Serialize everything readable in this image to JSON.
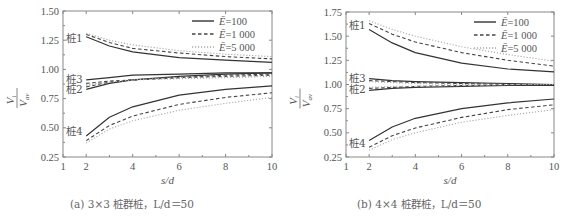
{
  "chart_data": [
    {
      "type": "line",
      "panel": "a",
      "caption": "(a) 3×3 桩群桩，L/d＝50",
      "xlabel": "s/d",
      "ylabel": "V_i / V_av",
      "xlim": [
        1,
        10
      ],
      "ylim": [
        0.25,
        1.5
      ],
      "xticks": [
        1,
        2,
        4,
        6,
        8,
        10
      ],
      "yticks": [
        "0.25",
        "0.50",
        "0.75",
        "1.00",
        "1.25",
        "1.50"
      ],
      "grid": false,
      "legend_position": "upper right",
      "legend": [
        "Ē=100",
        "Ē=1 000",
        "Ē=5 000"
      ],
      "x": [
        2,
        3,
        4,
        6,
        8,
        10
      ],
      "series": [
        {
          "pile": "桩1",
          "name": "Ē=100",
          "style": "solid",
          "values": [
            1.28,
            1.2,
            1.15,
            1.1,
            1.08,
            1.06
          ]
        },
        {
          "pile": "桩1",
          "name": "Ē=1 000",
          "style": "dashed",
          "values": [
            1.3,
            1.23,
            1.18,
            1.14,
            1.11,
            1.09
          ]
        },
        {
          "pile": "桩1",
          "name": "Ē=5 000",
          "style": "dotted",
          "values": [
            1.31,
            1.25,
            1.21,
            1.16,
            1.13,
            1.11
          ]
        },
        {
          "pile": "桩3",
          "name": "Ē=100",
          "style": "solid",
          "values": [
            0.91,
            0.93,
            0.95,
            0.96,
            0.97,
            0.97
          ]
        },
        {
          "pile": "桩3",
          "name": "Ē=1 000",
          "style": "dashed",
          "values": [
            0.88,
            0.9,
            0.91,
            0.93,
            0.94,
            0.95
          ]
        },
        {
          "pile": "桩3",
          "name": "Ē=5 000",
          "style": "dotted",
          "values": [
            0.87,
            0.89,
            0.91,
            0.92,
            0.93,
            0.94
          ]
        },
        {
          "pile": "桩2",
          "name": "Ē=100",
          "style": "solid",
          "values": [
            0.83,
            0.88,
            0.91,
            0.94,
            0.96,
            0.97
          ]
        },
        {
          "pile": "桩2",
          "name": "Ē=1 000",
          "style": "dashed",
          "values": [
            0.85,
            0.89,
            0.91,
            0.93,
            0.95,
            0.96
          ]
        },
        {
          "pile": "桩2",
          "name": "Ē=5 000",
          "style": "dotted",
          "values": [
            0.86,
            0.89,
            0.91,
            0.93,
            0.94,
            0.95
          ]
        },
        {
          "pile": "桩4",
          "name": "Ē=100",
          "style": "solid",
          "values": [
            0.43,
            0.59,
            0.68,
            0.78,
            0.83,
            0.86
          ]
        },
        {
          "pile": "桩4",
          "name": "Ē=1 000",
          "style": "dashed",
          "values": [
            0.39,
            0.52,
            0.6,
            0.7,
            0.76,
            0.8
          ]
        },
        {
          "pile": "桩4",
          "name": "Ē=5 000",
          "style": "dotted",
          "values": [
            0.37,
            0.49,
            0.56,
            0.65,
            0.71,
            0.76
          ]
        }
      ],
      "pile_labels": [
        {
          "text": "桩1",
          "y": 1.27
        },
        {
          "text": "桩3",
          "y": 0.92
        },
        {
          "text": "桩2",
          "y": 0.83
        },
        {
          "text": "桩4",
          "y": 0.47
        }
      ]
    },
    {
      "type": "line",
      "panel": "b",
      "caption": "(b) 4×4 桩群桩，L/d＝50",
      "xlabel": "s/d",
      "ylabel": "V_i / V_av",
      "xlim": [
        1,
        10
      ],
      "ylim": [
        0.25,
        1.75
      ],
      "xticks": [
        1,
        2,
        4,
        6,
        8,
        10
      ],
      "yticks": [
        "0.25",
        "0.50",
        "0.75",
        "1.00",
        "1.25",
        "1.50",
        "1.75"
      ],
      "grid": false,
      "legend_position": "upper right",
      "legend": [
        "Ē=100",
        "Ē=1 000",
        "Ē=5 000"
      ],
      "x": [
        2,
        3,
        4,
        6,
        8,
        10
      ],
      "series": [
        {
          "pile": "桩1",
          "name": "Ē=100",
          "style": "solid",
          "values": [
            1.57,
            1.43,
            1.33,
            1.22,
            1.16,
            1.13
          ]
        },
        {
          "pile": "桩1",
          "name": "Ē=1 000",
          "style": "dashed",
          "values": [
            1.63,
            1.52,
            1.44,
            1.33,
            1.25,
            1.19
          ]
        },
        {
          "pile": "桩1",
          "name": "Ē=5 000",
          "style": "dotted",
          "values": [
            1.66,
            1.57,
            1.5,
            1.39,
            1.31,
            1.24
          ]
        },
        {
          "pile": "桩3",
          "name": "Ē=100",
          "style": "solid",
          "values": [
            1.06,
            1.04,
            1.03,
            1.02,
            1.01,
            1.0
          ]
        },
        {
          "pile": "桩3",
          "name": "Ē=1 000",
          "style": "dashed",
          "values": [
            1.04,
            1.03,
            1.02,
            1.01,
            1.0,
            1.0
          ]
        },
        {
          "pile": "桩3",
          "name": "Ē=5 000",
          "style": "dotted",
          "values": [
            1.03,
            1.02,
            1.01,
            1.0,
            1.0,
            0.99
          ]
        },
        {
          "pile": "桩2",
          "name": "Ē=100",
          "style": "solid",
          "values": [
            0.94,
            0.96,
            0.97,
            0.98,
            0.99,
            0.99
          ]
        },
        {
          "pile": "桩2",
          "name": "Ē=1 000",
          "style": "dashed",
          "values": [
            0.96,
            0.97,
            0.98,
            0.99,
            0.99,
            1.0
          ]
        },
        {
          "pile": "桩2",
          "name": "Ē=5 000",
          "style": "dotted",
          "values": [
            0.97,
            0.98,
            0.98,
            0.99,
            1.0,
            1.0
          ]
        },
        {
          "pile": "桩4",
          "name": "Ē=100",
          "style": "solid",
          "values": [
            0.42,
            0.56,
            0.65,
            0.75,
            0.81,
            0.85
          ]
        },
        {
          "pile": "桩4",
          "name": "Ē=1 000",
          "style": "dashed",
          "values": [
            0.35,
            0.47,
            0.55,
            0.66,
            0.74,
            0.79
          ]
        },
        {
          "pile": "桩4",
          "name": "Ē=5 000",
          "style": "dotted",
          "values": [
            0.32,
            0.43,
            0.5,
            0.61,
            0.68,
            0.74
          ]
        }
      ],
      "pile_labels": [
        {
          "text": "桩1",
          "y": 1.62
        },
        {
          "text": "桩3",
          "y": 1.07
        },
        {
          "text": "桩2",
          "y": 0.95
        },
        {
          "text": "桩4",
          "y": 0.39
        }
      ]
    }
  ],
  "captions": {
    "a": "(a) 3×3 桩群桩，L/d＝50",
    "b": "(b) 4×4 桩群桩，L/d＝50"
  },
  "colors": {
    "axis": "#888888",
    "solid": "#333333",
    "dashed": "#444444",
    "dotted": "#aaaaaa",
    "text": "#555555"
  }
}
